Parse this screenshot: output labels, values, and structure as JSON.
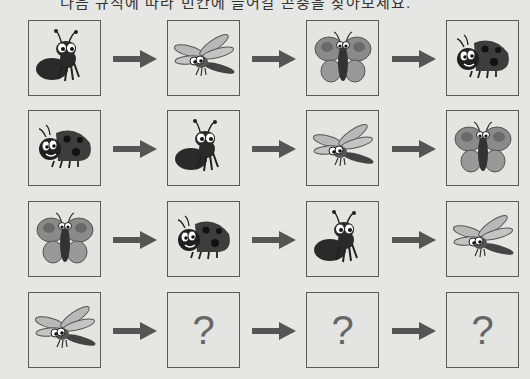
{
  "title": "다음 규칙에 따라 빈칸에 들어갈 곤충을 찾아보세요.",
  "arrow_icon": "right-arrow-icon",
  "colors": {
    "background": "#e6e6e4",
    "card_border": "#5a5a5a",
    "arrow": "#555555",
    "question_mark": "#666666"
  },
  "rows": [
    {
      "cards": [
        "ant",
        "dragonfly",
        "butterfly",
        "ladybug"
      ]
    },
    {
      "cards": [
        "ladybug",
        "ant",
        "dragonfly",
        "butterfly"
      ]
    },
    {
      "cards": [
        "butterfly",
        "ladybug",
        "ant",
        "dragonfly"
      ]
    },
    {
      "cards": [
        "dragonfly",
        "?",
        "?",
        "?"
      ]
    }
  ],
  "question_mark": "?"
}
